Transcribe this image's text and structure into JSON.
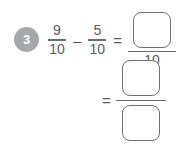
{
  "problem": {
    "number": "3",
    "badge_color": "#a6a8aa",
    "text_color": "#5a5b5d",
    "background_color": "#ffffff",
    "expression": {
      "operand_1": {
        "numerator": "9",
        "denominator": "10"
      },
      "operator": "–",
      "operand_2": {
        "numerator": "5",
        "denominator": "10"
      },
      "equals": "=",
      "result_1": {
        "numerator_value": "",
        "numerator_placeholder": "",
        "denominator": "10"
      }
    },
    "simplified": {
      "equals": "=",
      "numerator_value": "",
      "denominator_value": ""
    }
  }
}
